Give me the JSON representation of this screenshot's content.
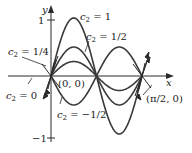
{
  "figure": {
    "type": "function-family-plot",
    "equation": "y = c2 sin(4x)",
    "axes": {
      "x_label": "x",
      "y_label": "y",
      "y_ticks": [
        {
          "value": 1,
          "label": "1"
        },
        {
          "value": -1,
          "label": "−1"
        }
      ]
    },
    "points": [
      {
        "label": "(0, 0)"
      },
      {
        "label": "(π/2, 0)"
      }
    ],
    "curves": [
      {
        "c2": 1,
        "label_var": "c",
        "label_sub": "2",
        "label_val": " = 1"
      },
      {
        "c2": 0.5,
        "label_var": "c",
        "label_sub": "2",
        "label_val": " = 1/2"
      },
      {
        "c2": 0.25,
        "label_var": "c",
        "label_sub": "2",
        "label_val": " = 1/4"
      },
      {
        "c2": 0,
        "label_var": "c",
        "label_sub": "2",
        "label_val": " = 0"
      },
      {
        "c2": -0.5,
        "label_var": "c",
        "label_sub": "2",
        "label_val": " = −1/2"
      }
    ],
    "colors": {
      "curve": "#3a3a3a",
      "axis": "#2a2a2a",
      "text": "#222222"
    }
  }
}
